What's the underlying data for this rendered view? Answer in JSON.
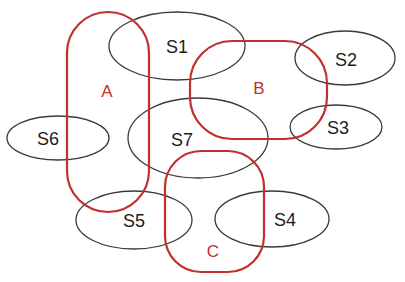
{
  "diagram": {
    "type": "set-cover / grouping diagram",
    "sets": [
      {
        "id": "S1",
        "label": "S1"
      },
      {
        "id": "S2",
        "label": "S2"
      },
      {
        "id": "S3",
        "label": "S3"
      },
      {
        "id": "S4",
        "label": "S4"
      },
      {
        "id": "S5",
        "label": "S5"
      },
      {
        "id": "S6",
        "label": "S6"
      },
      {
        "id": "S7",
        "label": "S7"
      }
    ],
    "groups": [
      {
        "id": "A",
        "label": "A",
        "color": "#c0302c"
      },
      {
        "id": "B",
        "label": "B",
        "color": "#c0302c"
      },
      {
        "id": "C",
        "label": "C",
        "color": "#c0302c"
      }
    ],
    "colors": {
      "set_stroke": "#3a3a3a",
      "group_stroke": "#c0302c",
      "background": "#ffffff"
    }
  }
}
